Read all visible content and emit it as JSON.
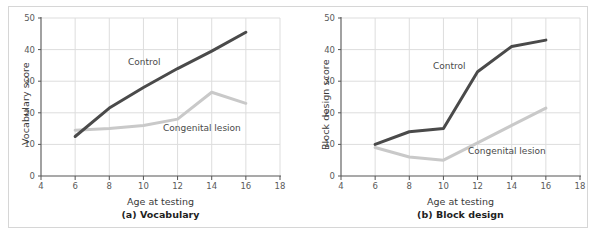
{
  "figure": {
    "background_color": "#ffffff",
    "border_color": "#d6d6d6",
    "control_color": "#4a4a4a",
    "lesion_color": "#c9c9c9",
    "grid_color": "#dddddd",
    "axis_color": "#555555"
  },
  "panels": [
    {
      "id": "a",
      "caption": "(a) Vocabulary",
      "xlabel": "Age at testing",
      "ylabel": "Vocabulary score",
      "control_label": "Control",
      "lesion_label": "Congenital lesion"
    },
    {
      "id": "b",
      "caption": "(b) Block design",
      "xlabel": "Age at testing",
      "ylabel": "Block design score",
      "control_label": "Control",
      "lesion_label": "Congenital lesion"
    }
  ],
  "chart_data": [
    {
      "type": "line",
      "title": "(a) Vocabulary",
      "xlabel": "Age at testing",
      "ylabel": "Vocabulary score",
      "x": [
        6,
        8,
        10,
        12,
        14,
        16
      ],
      "xlim": [
        4,
        18
      ],
      "ylim": [
        0,
        50
      ],
      "xticks": [
        4,
        6,
        8,
        10,
        12,
        14,
        16,
        18
      ],
      "yticks": [
        0,
        10,
        20,
        30,
        40,
        50
      ],
      "grid": true,
      "legend": "inline-annotations",
      "series": [
        {
          "name": "Control",
          "color": "#4a4a4a",
          "values": [
            12.5,
            21.5,
            28.0,
            34.0,
            39.5,
            45.5
          ]
        },
        {
          "name": "Congenital lesion",
          "color": "#c9c9c9",
          "values": [
            14.5,
            15.0,
            16.0,
            18.0,
            26.5,
            23.0
          ]
        }
      ]
    },
    {
      "type": "line",
      "title": "(b) Block design",
      "xlabel": "Age at testing",
      "ylabel": "Block design score",
      "x": [
        6,
        8,
        10,
        12,
        14,
        16
      ],
      "xlim": [
        4,
        18
      ],
      "ylim": [
        0,
        50
      ],
      "xticks": [
        4,
        6,
        8,
        10,
        12,
        14,
        16,
        18
      ],
      "yticks": [
        0,
        10,
        20,
        30,
        40,
        50
      ],
      "grid": true,
      "legend": "inline-annotations",
      "series": [
        {
          "name": "Control",
          "color": "#4a4a4a",
          "values": [
            10.0,
            14.0,
            15.0,
            33.0,
            41.0,
            43.0
          ]
        },
        {
          "name": "Congenital lesion",
          "color": "#c9c9c9",
          "values": [
            9.0,
            6.0,
            5.0,
            10.5,
            16.0,
            21.5
          ]
        }
      ]
    }
  ]
}
